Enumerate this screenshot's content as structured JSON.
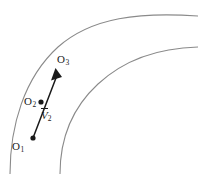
{
  "figure": {
    "background_color": "#ffffff",
    "stroke_color": "#8a8a8a",
    "ink_color": "#1a1a1a",
    "points": [
      {
        "id": "o1",
        "label": "O",
        "sub": "1",
        "x": 33,
        "y": 138
      },
      {
        "id": "o2",
        "label": "O",
        "sub": "2",
        "x": 41,
        "y": 102
      },
      {
        "id": "o3",
        "label": "O",
        "sub": "3",
        "x": 56,
        "y": 70
      }
    ],
    "vector": {
      "symbol": "V",
      "sub": "2",
      "overbar": true
    },
    "arcs": [
      {
        "id": "outer-arc",
        "description": "outer boundary curve of annular band"
      },
      {
        "id": "inner-arc",
        "description": "inner boundary curve of annular band"
      }
    ],
    "arrow": {
      "id": "velocity-arrow",
      "from": "o1",
      "through": "o2",
      "to": "o3",
      "head": "filled"
    }
  }
}
